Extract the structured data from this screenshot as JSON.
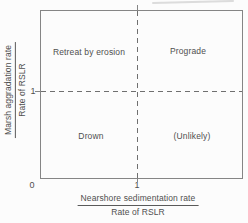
{
  "colors": {
    "background": "#fcfcfc",
    "border": "#858585",
    "dashed_lines": "#6f6f6f",
    "text": "#4f4f4f"
  },
  "axes": {
    "x": {
      "label_numerator": "Nearshore sedimentation rate",
      "label_denominator": "Rate of RSLR",
      "origin_tick": "0",
      "unit_tick": "1"
    },
    "y": {
      "label_numerator": "Marsh aggradation rate",
      "label_denominator": "Rate of RSLR",
      "unit_tick": "1"
    }
  },
  "quadrants": {
    "top_left": "Retreat by erosion",
    "top_right": "Prograde",
    "bottom_left": "Drown",
    "bottom_right": "(Unlikely)"
  },
  "chart_data": {
    "type": "scatter",
    "title": "",
    "xlabel": "Nearshore sedimentation rate / Rate of RSLR",
    "ylabel": "Marsh aggradation rate / Rate of RSLR",
    "xlim": [
      0,
      2
    ],
    "ylim": [
      0,
      2
    ],
    "x_ticks": [
      0,
      1
    ],
    "y_ticks": [
      1
    ],
    "grid": false,
    "series": [],
    "reference_lines": [
      {
        "axis": "x",
        "value": 1,
        "style": "dashed"
      },
      {
        "axis": "y",
        "value": 1,
        "style": "dashed"
      }
    ],
    "annotations": [
      {
        "text": "Retreat by erosion",
        "region": "x < 1, y > 1"
      },
      {
        "text": "Prograde",
        "region": "x > 1, y > 1"
      },
      {
        "text": "Drown",
        "region": "x < 1, y < 1"
      },
      {
        "text": "(Unlikely)",
        "region": "x > 1, y < 1"
      }
    ]
  }
}
